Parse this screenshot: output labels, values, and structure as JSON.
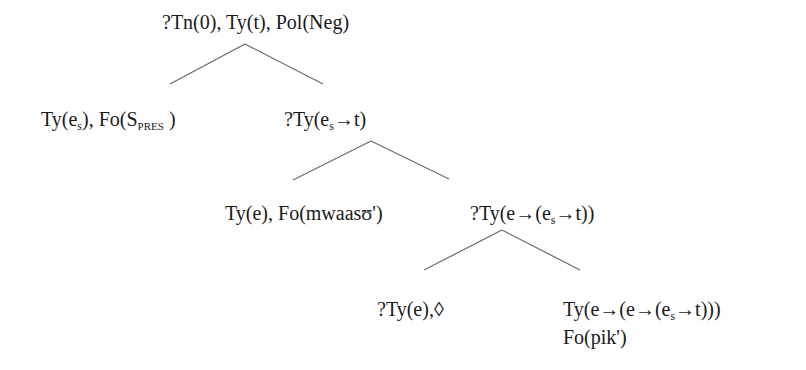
{
  "diagram": {
    "type": "tree",
    "title": "",
    "nodes": [
      {
        "id": "root",
        "label": "?Tn(0), Ty(t), Pol(Neg)",
        "parts": {
          "text": "?Tn(0), Ty(t), Pol(Neg)"
        },
        "children": [
          "subject",
          "predicate"
        ]
      },
      {
        "id": "subject",
        "label": "Ty(es), Fo(SPRES)",
        "parts": {
          "a": "Ty(e",
          "a_sub": "s",
          "b": "), Fo(S",
          "b_sub": "PRES",
          "c": " )"
        },
        "children": []
      },
      {
        "id": "predicate",
        "label": "?Ty(es→t)",
        "parts": {
          "a": "?Ty(e",
          "a_sub": "s",
          "b": "→t)"
        },
        "children": [
          "object",
          "functor"
        ]
      },
      {
        "id": "object",
        "label": "Ty(e), Fo(mwaasʊ')",
        "parts": {
          "text": "Ty(e), Fo(mwaasʊ')"
        },
        "children": []
      },
      {
        "id": "functor",
        "label": "?Ty(e→(es→t))",
        "parts": {
          "a": "?Ty(e→(e",
          "a_sub": "s",
          "b": "→t))"
        },
        "children": [
          "pointer",
          "verb"
        ]
      },
      {
        "id": "pointer",
        "label": "?Ty(e),◊",
        "parts": {
          "text": "?Ty(e),◊"
        },
        "children": []
      },
      {
        "id": "verb",
        "label": "Ty(e→(e→(es→t))) Fo(pik')",
        "parts": {
          "line1_a": "Ty(e→(e→(e",
          "line1_sub": "s",
          "line1_b": "→t)))",
          "line2": "Fo(pik')"
        },
        "children": []
      }
    ],
    "edges": [
      {
        "from": "root",
        "to": "subject",
        "x1": 245,
        "y1": 44,
        "x2": 170,
        "y2": 84
      },
      {
        "from": "root",
        "to": "predicate",
        "x1": 245,
        "y1": 44,
        "x2": 323,
        "y2": 84
      },
      {
        "from": "predicate",
        "to": "object",
        "x1": 371,
        "y1": 141,
        "x2": 293,
        "y2": 180
      },
      {
        "from": "predicate",
        "to": "functor",
        "x1": 371,
        "y1": 141,
        "x2": 449,
        "y2": 179
      },
      {
        "from": "functor",
        "to": "pointer",
        "x1": 502,
        "y1": 230,
        "x2": 424,
        "y2": 270
      },
      {
        "from": "functor",
        "to": "verb",
        "x1": 502,
        "y1": 230,
        "x2": 580,
        "y2": 270
      }
    ],
    "colors": {
      "text": "#1a1a1a",
      "edge": "#6b6b6b",
      "background": "#ffffff"
    }
  }
}
